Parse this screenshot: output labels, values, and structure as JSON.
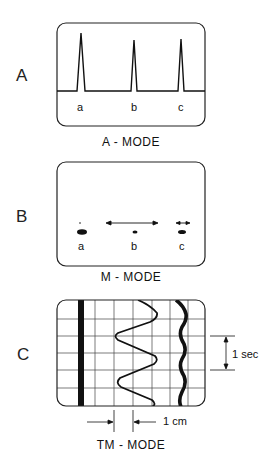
{
  "panels": {
    "a": {
      "letter": "A",
      "caption": "A - MODE",
      "peaks": [
        "a",
        "b",
        "c"
      ]
    },
    "b": {
      "letter": "B",
      "caption": "M - MODE",
      "dots": [
        "a",
        "b",
        "c"
      ]
    },
    "c": {
      "letter": "C",
      "caption": "TM - MODE",
      "time_scale": "1 sec",
      "distance_scale": "1 cm"
    }
  }
}
